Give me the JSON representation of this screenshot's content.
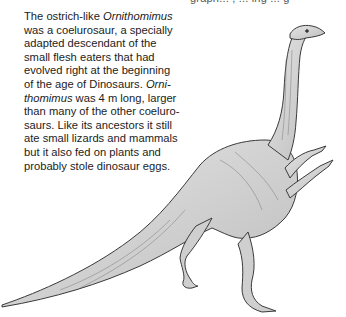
{
  "page": {
    "top_cropped_text": "graph... , ... ing ... g",
    "paragraph": {
      "lines": [
        {
          "pre": "The ostrich-like ",
          "em": "Ornithomimus",
          "post": ""
        },
        {
          "pre": "was a coelurosaur, a specially",
          "em": "",
          "post": ""
        },
        {
          "pre": "adapted descendant of the",
          "em": "",
          "post": ""
        },
        {
          "pre": "small flesh eaters that had",
          "em": "",
          "post": ""
        },
        {
          "pre": "evolved right at the beginning",
          "em": "",
          "post": ""
        },
        {
          "pre": "of the age of Dinosaurs. ",
          "em": "Orni-",
          "post": ""
        },
        {
          "pre": "",
          "em": "thomimus",
          "post": " was 4 m long, larger"
        },
        {
          "pre": "than many of the other coeluro-",
          "em": "",
          "post": ""
        },
        {
          "pre": "saurs. Like its ancestors it still",
          "em": "",
          "post": ""
        },
        {
          "pre": "ate small lizards and mammals",
          "em": "",
          "post": ""
        },
        {
          "pre": "but it also fed on plants and",
          "em": "",
          "post": ""
        },
        {
          "pre": "probably stole dinosaur eggs.",
          "em": "",
          "post": ""
        }
      ]
    },
    "illustration": {
      "subject": "Ornithomimus",
      "style": "pencil-sketch",
      "stroke_color": "#3a3a3a",
      "fill_color": "#d9d9d9"
    }
  }
}
